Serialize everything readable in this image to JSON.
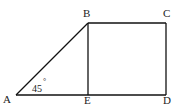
{
  "diagram": {
    "type": "geometry",
    "points": {
      "A": {
        "label": "A",
        "x": 16,
        "y": 95
      },
      "B": {
        "label": "B",
        "x": 88,
        "y": 23
      },
      "C": {
        "label": "C",
        "x": 166,
        "y": 23
      },
      "D": {
        "label": "D",
        "x": 166,
        "y": 95
      },
      "E": {
        "label": "E",
        "x": 88,
        "y": 95
      }
    },
    "segments": [
      "AB",
      "BC",
      "CD",
      "DA",
      "BE"
    ],
    "angle_label": {
      "text": "45",
      "degree": "°",
      "at": "A"
    }
  }
}
